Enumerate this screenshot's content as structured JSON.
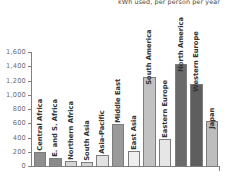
{
  "chart_data": {
    "type": "bar",
    "title": "kWh used, per person per year",
    "xlabel": "",
    "ylabel": "",
    "ylim": [
      0,
      1600
    ],
    "grid": false,
    "legend": null,
    "y_ticks": [
      "1,600",
      "1,400",
      "1,200",
      "1,000",
      "800",
      "600",
      "400",
      "200",
      "0"
    ],
    "y_tick_values": [
      1600,
      1400,
      1200,
      1000,
      800,
      600,
      400,
      200,
      0
    ],
    "categories": [
      "Central Africa",
      "E. and S. Africa",
      "Northern Africa",
      "South Asia",
      "Asia-Pacific",
      "Middle East",
      "East Asia",
      "South America",
      "Eastern Europe",
      "North America",
      "Western Europe",
      "Japan"
    ],
    "values": [
      210,
      130,
      85,
      70,
      170,
      600,
      225,
      1265,
      400,
      1450,
      1160,
      650
    ],
    "bar_colors": [
      "#8f8f8f",
      "#8a8a8a",
      "#d6d6d6",
      "#d2d2d2",
      "#e2e2e2",
      "#9a9a9a",
      "#efefef",
      "#c2c2c2",
      "#e6e6e6",
      "#6a6a6a",
      "#5e5e5e",
      "#bdbdbd"
    ]
  }
}
